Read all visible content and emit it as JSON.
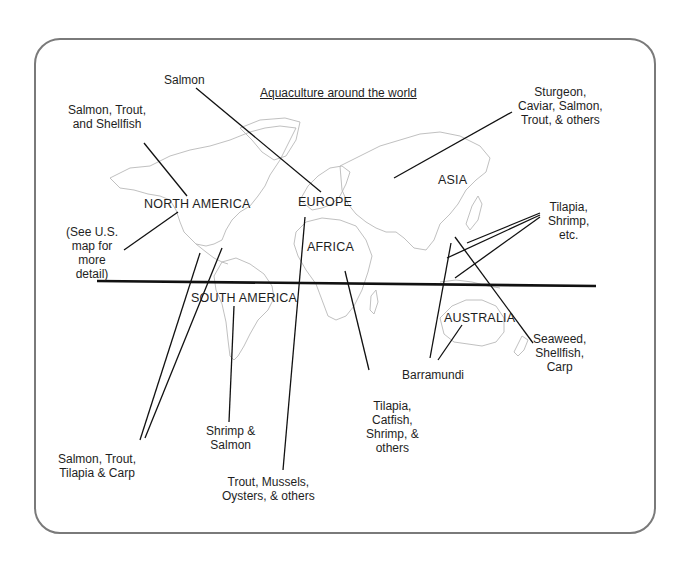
{
  "title": "Aquaculture around the world",
  "regions": {
    "north_america": "NORTH AMERICA",
    "south_america": "SOUTH AMERICA",
    "europe": "EUROPE",
    "africa": "AFRICA",
    "asia": "ASIA",
    "australia": "AUSTRALIA"
  },
  "callouts": {
    "salmon": {
      "lines": [
        "Salmon"
      ]
    },
    "salmon_trout_shellfish": {
      "lines": [
        "Salmon, Trout,",
        "and Shellfish"
      ]
    },
    "see_us_map": {
      "lines": [
        "(See U.S.",
        "map for",
        "more",
        "detail)"
      ]
    },
    "sturgeon": {
      "lines": [
        "Sturgeon,",
        "Caviar, Salmon,",
        "Trout, & others"
      ]
    },
    "tilapia_shrimp_etc": {
      "lines": [
        "Tilapia,",
        "Shrimp,",
        "etc."
      ]
    },
    "seaweed": {
      "lines": [
        "Seaweed,",
        "Shellfish,",
        "Carp"
      ]
    },
    "barramundi": {
      "lines": [
        "Barramundi"
      ]
    },
    "tilapia_catfish": {
      "lines": [
        "Tilapia,",
        "Catfish,",
        "Shrimp, &",
        "others"
      ]
    },
    "shrimp_salmon": {
      "lines": [
        "Shrimp &",
        "Salmon"
      ]
    },
    "salmon_trout_tilapia_carp": {
      "lines": [
        "Salmon, Trout,",
        "Tilapia & Carp"
      ]
    },
    "trout_mussels": {
      "lines": [
        "Trout, Mussels,",
        "Oysters, & others"
      ]
    }
  },
  "colors": {
    "frame_border": "#7a7a7a",
    "leader_line": "#111111",
    "coastline": "#b9b9b9",
    "text": "#1e1e1e"
  }
}
